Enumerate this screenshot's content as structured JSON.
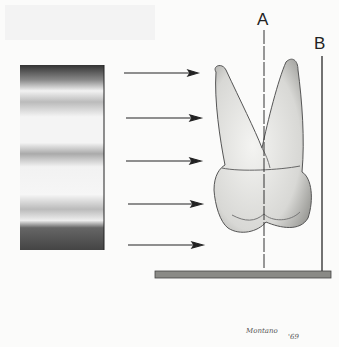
{
  "figure": {
    "type": "illustration",
    "labels": {
      "a": "A",
      "b": "B"
    },
    "signature": {
      "name": "Montano",
      "year": "'69"
    },
    "arrows": [
      73,
      118,
      161,
      204,
      245
    ],
    "colors": {
      "background": "#fbfbfa",
      "ink": "#222222",
      "tooth": "#e4e4e2",
      "base": "#8a8a86"
    }
  }
}
